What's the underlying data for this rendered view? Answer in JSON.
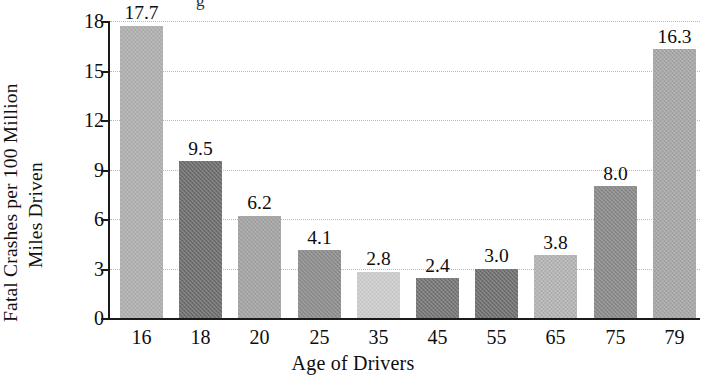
{
  "chart_data": {
    "type": "bar",
    "title": "",
    "xlabel": "Age of Drivers",
    "ylabel_line1": "Fatal Crashes per 100 Million",
    "ylabel_line2": "Miles Driven",
    "categories": [
      "16",
      "18",
      "20",
      "25",
      "35",
      "45",
      "55",
      "65",
      "75",
      "79"
    ],
    "values": [
      17.7,
      9.5,
      6.2,
      4.1,
      2.8,
      2.4,
      3.0,
      3.8,
      8.0,
      16.3
    ],
    "value_labels": [
      "17.7",
      "9.5",
      "6.2",
      "4.1",
      "2.8",
      "2.4",
      "3.0",
      "3.8",
      "8.0",
      "16.3"
    ],
    "bar_colors": [
      "#b0b0b0",
      "#6e6e6e",
      "#a3a3a3",
      "#8d8d8d",
      "#cdcdcd",
      "#767676",
      "#707070",
      "#b4b4b4",
      "#8a8a8a",
      "#a6a6a6"
    ],
    "ylim": [
      0,
      18
    ],
    "yticks": [
      0,
      3,
      6,
      9,
      12,
      15,
      18
    ],
    "ytick_labels": [
      "0",
      "3",
      "6",
      "9",
      "12",
      "15",
      "18"
    ],
    "grid": true,
    "grid_style": "dotted",
    "legend": "none",
    "axis_color": "#1a1a1a",
    "grid_color": "#b9b9b9",
    "background": "#ffffff"
  },
  "artifacts": {
    "clipped_top_glyph": "g"
  }
}
